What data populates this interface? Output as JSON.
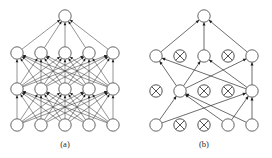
{
  "figure": {
    "background_color": "#ffffff",
    "line_color": "#3a3a3a",
    "node_fill": "#ffffff",
    "node_stroke": "#4a4a4a",
    "caption_color": "#2b2b2b"
  },
  "panels": [
    {
      "id": "a",
      "caption": "(a)",
      "description": "Fully connected neural network before pruning",
      "caption_x": 65,
      "caption_y": 147,
      "node_radius": 6.2,
      "layers": [
        {
          "name": "output-layer",
          "y": 16,
          "nodes": [
            {
              "id": "a-o-1",
              "x": 65,
              "state": "active"
            }
          ]
        },
        {
          "name": "hidden-layer-2",
          "y": 53,
          "nodes": [
            {
              "id": "a-h2-1",
              "x": 17,
              "state": "active"
            },
            {
              "id": "a-h2-2",
              "x": 41,
              "state": "active"
            },
            {
              "id": "a-h2-3",
              "x": 65,
              "state": "active"
            },
            {
              "id": "a-h2-4",
              "x": 89,
              "state": "active"
            },
            {
              "id": "a-h2-5",
              "x": 113,
              "state": "active"
            }
          ]
        },
        {
          "name": "hidden-layer-1",
          "y": 89,
          "nodes": [
            {
              "id": "a-h1-1",
              "x": 17,
              "state": "active"
            },
            {
              "id": "a-h1-2",
              "x": 41,
              "state": "active"
            },
            {
              "id": "a-h1-3",
              "x": 65,
              "state": "active"
            },
            {
              "id": "a-h1-4",
              "x": 89,
              "state": "active"
            },
            {
              "id": "a-h1-5",
              "x": 113,
              "state": "active"
            }
          ]
        },
        {
          "name": "input-layer",
          "y": 125,
          "nodes": [
            {
              "id": "a-i-1",
              "x": 17,
              "state": "active"
            },
            {
              "id": "a-i-2",
              "x": 41,
              "state": "active"
            },
            {
              "id": "a-i-3",
              "x": 65,
              "state": "active"
            },
            {
              "id": "a-i-4",
              "x": 89,
              "state": "active"
            },
            {
              "id": "a-i-5",
              "x": 113,
              "state": "active"
            }
          ]
        }
      ],
      "connectivity": "fully-connected"
    },
    {
      "id": "b",
      "caption": "(b)",
      "description": "Sparse neural network after pruning; crossed circles mark removed units",
      "caption_x": 204,
      "caption_y": 147,
      "node_radius": 6.2,
      "layers": [
        {
          "name": "output-layer",
          "y": 16,
          "nodes": [
            {
              "id": "b-o-1",
              "x": 204,
              "state": "active"
            }
          ]
        },
        {
          "name": "hidden-layer-2",
          "y": 56,
          "nodes": [
            {
              "id": "b-h2-1",
              "x": 156,
              "state": "active"
            },
            {
              "id": "b-h2-2",
              "x": 180,
              "state": "pruned"
            },
            {
              "id": "b-h2-3",
              "x": 204,
              "state": "active"
            },
            {
              "id": "b-h2-4",
              "x": 228,
              "state": "pruned"
            },
            {
              "id": "b-h2-5",
              "x": 252,
              "state": "active"
            }
          ]
        },
        {
          "name": "hidden-layer-1",
          "y": 91,
          "nodes": [
            {
              "id": "b-h1-1",
              "x": 156,
              "state": "pruned"
            },
            {
              "id": "b-h1-2",
              "x": 180,
              "state": "active"
            },
            {
              "id": "b-h1-3",
              "x": 204,
              "state": "pruned"
            },
            {
              "id": "b-h1-4",
              "x": 228,
              "state": "pruned"
            },
            {
              "id": "b-h1-5",
              "x": 252,
              "state": "active"
            }
          ]
        },
        {
          "name": "input-layer",
          "y": 125,
          "nodes": [
            {
              "id": "b-i-1",
              "x": 156,
              "state": "active"
            },
            {
              "id": "b-i-2",
              "x": 180,
              "state": "pruned"
            },
            {
              "id": "b-i-3",
              "x": 204,
              "state": "pruned"
            },
            {
              "id": "b-i-4",
              "x": 228,
              "state": "active"
            },
            {
              "id": "b-i-5",
              "x": 252,
              "state": "active"
            }
          ]
        }
      ],
      "edges": [
        {
          "from": "b-h2-1",
          "to": "b-o-1"
        },
        {
          "from": "b-h2-3",
          "to": "b-o-1"
        },
        {
          "from": "b-h2-5",
          "to": "b-o-1"
        },
        {
          "from": "b-h1-2",
          "to": "b-h2-1"
        },
        {
          "from": "b-h1-5",
          "to": "b-h2-1"
        },
        {
          "from": "b-h1-2",
          "to": "b-h2-3"
        },
        {
          "from": "b-h1-5",
          "to": "b-h2-3"
        },
        {
          "from": "b-h1-2",
          "to": "b-h2-5"
        },
        {
          "from": "b-h1-5",
          "to": "b-h2-5"
        },
        {
          "from": "b-i-1",
          "to": "b-h1-2"
        },
        {
          "from": "b-i-4",
          "to": "b-h1-2"
        },
        {
          "from": "b-i-5",
          "to": "b-h1-2"
        },
        {
          "from": "b-i-1",
          "to": "b-h1-5"
        },
        {
          "from": "b-i-4",
          "to": "b-h1-5"
        },
        {
          "from": "b-i-5",
          "to": "b-h1-5"
        }
      ],
      "connectivity": "pruned-sparse"
    }
  ]
}
